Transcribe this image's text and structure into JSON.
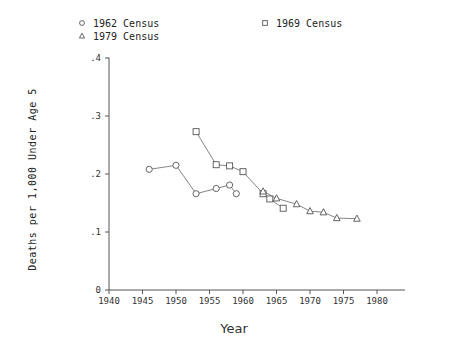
{
  "chart_data": {
    "type": "line",
    "title": "",
    "xlabel": "Year",
    "ylabel": "Deaths per 1,000 Under Age 5",
    "xlim": [
      1940,
      1980
    ],
    "ylim": [
      0,
      0.4
    ],
    "xticks": [
      1940,
      1945,
      1950,
      1955,
      1960,
      1965,
      1970,
      1975,
      1980
    ],
    "xticklabels": [
      "1940",
      "1945",
      "1950",
      "1955",
      "1960",
      "1965",
      "1970",
      "1975",
      "1980"
    ],
    "yticks": [
      0,
      0.1,
      0.2,
      0.3,
      0.4
    ],
    "yticklabels": [
      "0",
      ".1",
      ".2",
      ".3",
      ".4"
    ],
    "grid": false,
    "legend_position": "top",
    "series": [
      {
        "name": "1962 Census",
        "marker": "circle",
        "x": [
          1946,
          1950,
          1953,
          1956,
          1958,
          1959
        ],
        "y": [
          0.208,
          0.215,
          0.166,
          0.175,
          0.181,
          0.166
        ]
      },
      {
        "name": "1969 Census",
        "marker": "square",
        "x": [
          1953,
          1956,
          1958,
          1960,
          1963,
          1964,
          1966
        ],
        "y": [
          0.273,
          0.216,
          0.214,
          0.204,
          0.166,
          0.157,
          0.141
        ]
      },
      {
        "name": "1979 Census",
        "marker": "triangle",
        "x": [
          1963,
          1965,
          1968,
          1970,
          1972,
          1974,
          1977
        ],
        "y": [
          0.17,
          0.158,
          0.148,
          0.136,
          0.134,
          0.124,
          0.123
        ]
      }
    ]
  },
  "legend": {
    "entries": [
      {
        "label": "1962 Census",
        "marker": "circle"
      },
      {
        "label": "1969 Census",
        "marker": "square"
      },
      {
        "label": "1979 Census",
        "marker": "triangle"
      }
    ]
  },
  "axes": {
    "x_title": "Year",
    "y_title": "Deaths per 1,000 Under Age 5"
  },
  "colors": {
    "line": "#777777",
    "marker_stroke": "#555555",
    "marker_fill": "#ffffff",
    "axis": "#555555",
    "text": "#222222",
    "background": "#ffffff"
  }
}
